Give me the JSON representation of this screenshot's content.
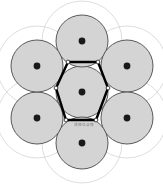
{
  "figure": {
    "caption_text": "活性位点阵",
    "canvas": {
      "width": 163,
      "height": 184
    },
    "colors": {
      "background": "#ffffff",
      "disk_fill": "#d4d4d4",
      "disk_stroke": "#4a4a4a",
      "halo_stroke": "#cfcfcf",
      "center_dot": "#1a1a1a",
      "hexagon_stroke": "#000000",
      "vertex_dot_fill": "#ffffff",
      "vertex_dot_stroke": "#000000",
      "label_text": "#6e6e6e"
    },
    "geometry": {
      "disk_radius": 26,
      "halo_radius": 40,
      "center_dot_radius": 3.4,
      "vertex_dot_radius": 1.9,
      "hexagon_stroke_width": 2.4,
      "disk_stroke_width": 0.9,
      "halo_stroke_width": 0.7
    },
    "lattice_points": [
      {
        "name": "center",
        "x": 82,
        "y": 92
      },
      {
        "name": "top",
        "x": 82,
        "y": 41
      },
      {
        "name": "upper-right",
        "x": 127,
        "y": 66
      },
      {
        "name": "lower-right",
        "x": 127,
        "y": 118
      },
      {
        "name": "bottom",
        "x": 82,
        "y": 143
      },
      {
        "name": "lower-left",
        "x": 37,
        "y": 118
      },
      {
        "name": "upper-left",
        "x": 37,
        "y": 66
      }
    ],
    "hexagon_vertices": [
      {
        "name": "vertex-left",
        "x": 56,
        "y": 88
      },
      {
        "name": "vertex-top-left",
        "x": 68,
        "y": 62
      },
      {
        "name": "vertex-top-right",
        "x": 98,
        "y": 62
      },
      {
        "name": "vertex-right",
        "x": 108,
        "y": 88
      },
      {
        "name": "vertex-bottom-right",
        "x": 96,
        "y": 120
      },
      {
        "name": "vertex-bottom-left",
        "x": 66,
        "y": 120
      }
    ],
    "label_position": {
      "x": 84,
      "y": 126
    }
  }
}
